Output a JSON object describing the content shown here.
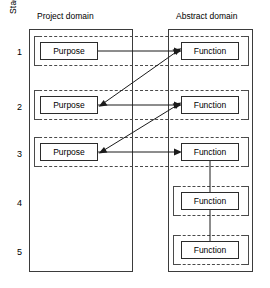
{
  "axis": {
    "label": "Stage",
    "stages": [
      "1",
      "2",
      "3",
      "4",
      "5"
    ]
  },
  "domains": [
    {
      "id": "project",
      "title": "Project domain"
    },
    {
      "id": "abstract",
      "title": "Abstract domain"
    }
  ],
  "nodes": {
    "purpose": [
      {
        "stage": "1",
        "label": "Purpose"
      },
      {
        "stage": "2",
        "label": "Purpose"
      },
      {
        "stage": "3",
        "label": "Purpose"
      }
    ],
    "function": [
      {
        "stage": "1",
        "label": "Function"
      },
      {
        "stage": "2",
        "label": "Function"
      },
      {
        "stage": "3",
        "label": "Function"
      },
      {
        "stage": "4",
        "label": "Function"
      },
      {
        "stage": "5",
        "label": "Function"
      }
    ]
  },
  "connectors": [
    {
      "id": "purpose1-to-function1",
      "kind": "horizontal-arrow",
      "from": "purpose-1",
      "to": "function-1"
    },
    {
      "id": "purpose2-to-function2",
      "kind": "horizontal-arrow",
      "from": "purpose-2",
      "to": "function-2"
    },
    {
      "id": "purpose3-to-function3",
      "kind": "horizontal-arrow",
      "from": "purpose-3",
      "to": "function-3"
    },
    {
      "id": "function1-to-purpose2",
      "kind": "diagonal-double-arrow",
      "from": "function-1",
      "to": "purpose-2"
    },
    {
      "id": "function2-to-purpose3",
      "kind": "diagonal-double-arrow",
      "from": "function-2",
      "to": "purpose-3"
    },
    {
      "id": "function3-to-function4",
      "kind": "vertical-arrow",
      "from": "function-3",
      "to": "function-4"
    },
    {
      "id": "function4-to-function5",
      "kind": "vertical-arrow",
      "from": "function-4",
      "to": "function-5"
    }
  ],
  "colors": {
    "stroke": "#2b2b2b",
    "dashed": "#4a4a4a",
    "arrow": "#1b1b1b",
    "background": "#ffffff"
  }
}
